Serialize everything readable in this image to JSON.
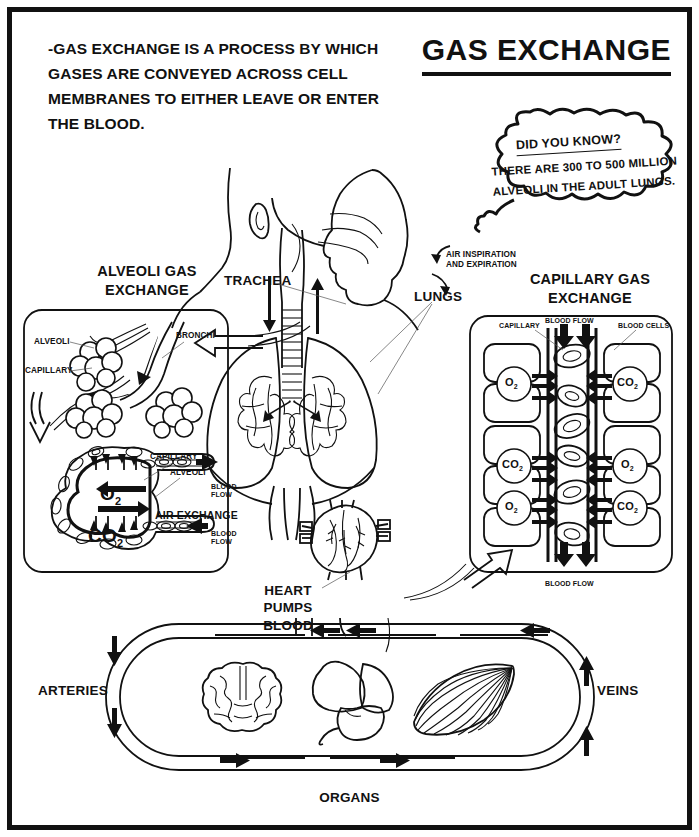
{
  "page": {
    "title": "GAS EXCHANGE",
    "intro": "-GAS EXCHANGE IS A PROCESS BY WHICH GASES ARE CONVEYED ACROSS CELL MEMBRANES TO EITHER LEAVE OR ENTER THE BLOOD."
  },
  "did_you_know": {
    "heading": "DID YOU KNOW?",
    "body": "THERE ARE 300 TO 500 MILLION ALVEOLI IN THE ADULT LUNGS."
  },
  "panels": {
    "alveoli": {
      "heading_line1": "ALVEOLI GAS",
      "heading_line2": "EXCHANGE",
      "labels": {
        "alveoli_top": "ALVEOLI",
        "capillary_top": "CAPILLARY",
        "bronchi": "BRONCHI",
        "capillary_detail": "CAPILLARY",
        "alveoli_detail": "ALVEOLI",
        "o2": "O",
        "o2_sub": "2",
        "co2": "CO",
        "co2_sub": "2",
        "air_exchange": "AIR EXCHANGE",
        "blood_flow_top": "BLOOD FLOW",
        "blood_flow_bottom": "BLOOD FLOW"
      }
    },
    "capillary": {
      "heading_line1": "CAPILLARY GAS",
      "heading_line2": "EXCHANGE",
      "labels": {
        "capillary": "CAPILLARY",
        "blood_flow_top": "BLOOD FLOW",
        "blood_cells": "BLOOD CELLS",
        "blood_flow_bottom": "BLOOD FLOW"
      },
      "rows": [
        {
          "left_gas": "O",
          "left_sub": "2",
          "right_gas": "CO",
          "right_sub": "2"
        },
        {
          "left_gas": "CO",
          "left_sub": "2",
          "right_gas": "O",
          "right_sub": "2"
        },
        {
          "left_gas": "O",
          "left_sub": "2",
          "right_gas": "CO",
          "right_sub": "2"
        }
      ]
    }
  },
  "anatomy": {
    "trachea": "TRACHEA",
    "lungs": "LUNGS",
    "air_flow_line1": "AIR INSPIRATION",
    "air_flow_line2": "AND EXPIRATION",
    "heart_line1": "HEART PUMPS",
    "heart_line2": "BLOOD"
  },
  "circulation": {
    "arteries": "ARTERIES",
    "veins": "VEINS",
    "organs": "ORGANS"
  },
  "colors": {
    "ink": "#111111",
    "paper": "#ffffff"
  }
}
